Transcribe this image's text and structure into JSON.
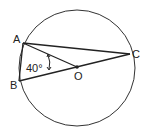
{
  "diagram": {
    "type": "circle-geometry",
    "circle": {
      "cx": 77,
      "cy": 68,
      "r": 58
    },
    "points": {
      "A": {
        "label": "A",
        "x": 23,
        "y": 43
      },
      "B": {
        "label": "B",
        "x": 19,
        "y": 81
      },
      "C": {
        "label": "C",
        "x": 130,
        "y": 54
      },
      "O": {
        "label": "O",
        "x": 77,
        "y": 67
      }
    },
    "segments": [
      "AC",
      "AO",
      "AB",
      "BO",
      "OC"
    ],
    "angle": {
      "label": "40°",
      "at": "O",
      "between": [
        "OA",
        "OB"
      ]
    }
  }
}
